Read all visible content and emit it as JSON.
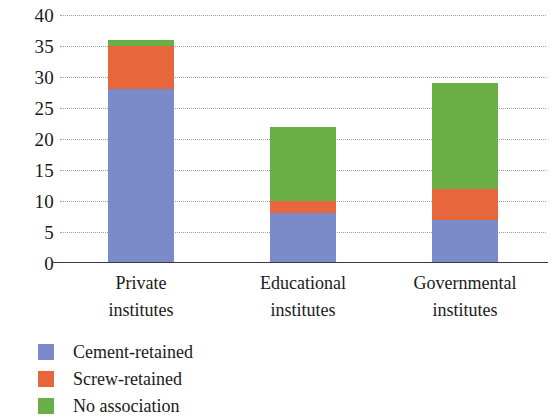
{
  "chart_data": {
    "type": "bar",
    "subtype": "stacked-bar",
    "title": "",
    "xlabel": "",
    "ylabel": "",
    "categories": [
      "Private institutes",
      "Educational institutes",
      "Governmental institutes"
    ],
    "category_lines": [
      [
        "Private",
        "institutes"
      ],
      [
        "Educational",
        "institutes"
      ],
      [
        "Governmental",
        "institutes"
      ]
    ],
    "series": [
      {
        "name": "Cement-retained",
        "color": "#7b8ac8",
        "values": [
          28,
          8,
          7
        ]
      },
      {
        "name": "Screw-retained",
        "color": "#e8663c",
        "values": [
          7,
          2,
          5
        ]
      },
      {
        "name": "No association",
        "color": "#6aaf46",
        "values": [
          1,
          12,
          17
        ]
      }
    ],
    "totals": [
      36,
      22,
      29
    ],
    "ylim": [
      0,
      40
    ],
    "ytick_values": [
      0,
      5,
      10,
      15,
      20,
      25,
      30,
      35,
      40
    ],
    "ytick_labels": [
      "0",
      "5",
      "10",
      "15",
      "20",
      "25",
      "30",
      "35",
      "40"
    ],
    "grid": "dotted-horizontal",
    "legend_position": "bottom-left",
    "legend_entries": [
      "Cement-retained",
      "Screw-retained",
      "No association"
    ]
  },
  "axis": {
    "y_tick_labels": [
      "40",
      "35",
      "30",
      "25",
      "20",
      "15",
      "10",
      "5",
      "0"
    ]
  },
  "colors": {
    "cement_retained": "#7b8ac8",
    "screw_retained": "#e8663c",
    "no_association": "#6aaf46",
    "axis": "#3a3a3a",
    "grid": "#8d8d8d",
    "background": "#ffffff",
    "text": "#1a1a1a"
  }
}
